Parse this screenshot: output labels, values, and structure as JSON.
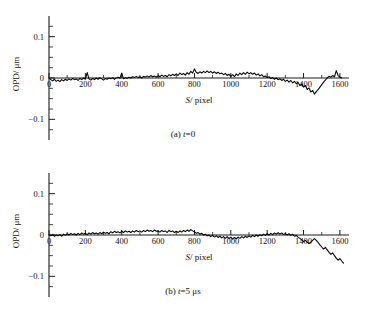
{
  "figure": {
    "panel_a_caption_prefix": "(a) ",
    "panel_a_caption_var": "t",
    "panel_a_caption_rest": "=0",
    "panel_b_caption_prefix": "(b) ",
    "panel_b_caption_var": "t",
    "panel_b_caption_rest": "=5 μs"
  },
  "axes": {
    "ylabel_main": "OPD",
    "ylabel_unit": "/ μm",
    "xlabel_var": "S",
    "xlabel_unit": "/ pixel",
    "x_ticks": [
      "0",
      "200",
      "400",
      "600",
      "800",
      "1000",
      "1200",
      "1400",
      "1600"
    ],
    "y_ticks": [
      "0.1",
      "0",
      "-0.1"
    ]
  },
  "chart_data": [
    {
      "type": "line",
      "title": "(a) t=0",
      "xlabel": "S/pixel",
      "ylabel": "OPD/μm",
      "xlim": [
        0,
        1650
      ],
      "ylim": [
        -0.15,
        0.15
      ],
      "grid": false,
      "legend": "none",
      "series": [
        {
          "name": "OPD t=0",
          "x": [
            0,
            10,
            20,
            30,
            40,
            50,
            60,
            70,
            80,
            90,
            100,
            110,
            120,
            130,
            140,
            150,
            160,
            170,
            180,
            190,
            200,
            210,
            220,
            230,
            240,
            250,
            260,
            270,
            280,
            290,
            300,
            310,
            320,
            330,
            340,
            350,
            360,
            370,
            380,
            390,
            400,
            410,
            420,
            430,
            440,
            450,
            460,
            470,
            480,
            490,
            500,
            510,
            520,
            530,
            540,
            550,
            560,
            570,
            580,
            590,
            600,
            610,
            620,
            630,
            640,
            650,
            660,
            670,
            680,
            690,
            700,
            710,
            720,
            730,
            740,
            750,
            760,
            770,
            780,
            790,
            800,
            810,
            820,
            830,
            840,
            850,
            860,
            870,
            880,
            890,
            900,
            910,
            920,
            930,
            940,
            950,
            960,
            970,
            980,
            990,
            1000,
            1010,
            1020,
            1030,
            1040,
            1050,
            1060,
            1070,
            1080,
            1090,
            1100,
            1110,
            1120,
            1130,
            1140,
            1150,
            1160,
            1170,
            1180,
            1190,
            1200,
            1210,
            1220,
            1230,
            1240,
            1250,
            1260,
            1270,
            1280,
            1290,
            1300,
            1310,
            1320,
            1330,
            1340,
            1350,
            1360,
            1370,
            1380,
            1390,
            1400,
            1410,
            1420,
            1430,
            1440,
            1450,
            1460,
            1470,
            1480,
            1490,
            1500,
            1510,
            1520,
            1530,
            1540,
            1550,
            1560,
            1570,
            1580,
            1590,
            1600,
            1610,
            1620
          ],
          "y": [
            0.0,
            -0.004,
            -0.007,
            -0.003,
            -0.008,
            -0.005,
            -0.009,
            -0.004,
            -0.007,
            -0.003,
            -0.006,
            -0.002,
            -0.005,
            -0.001,
            -0.004,
            -0.002,
            -0.006,
            -0.001,
            -0.004,
            0.0,
            -0.003,
            0.013,
            -0.002,
            -0.005,
            -0.001,
            -0.004,
            0.0,
            -0.003,
            0.001,
            -0.002,
            -0.005,
            -0.001,
            -0.003,
            0.0,
            -0.002,
            0.001,
            -0.003,
            0.0,
            0.002,
            -0.001,
            0.012,
            -0.002,
            0.001,
            -0.001,
            0.002,
            0.0,
            0.003,
            0.001,
            0.004,
            0.001,
            0.003,
            0.0,
            0.004,
            0.002,
            0.005,
            0.002,
            0.006,
            0.003,
            0.005,
            0.002,
            0.006,
            0.003,
            0.007,
            0.004,
            0.006,
            0.003,
            0.008,
            0.005,
            0.009,
            0.006,
            0.01,
            0.006,
            0.012,
            0.008,
            0.011,
            0.007,
            0.013,
            0.009,
            0.016,
            0.012,
            0.022,
            0.014,
            0.011,
            0.015,
            0.012,
            0.016,
            0.013,
            0.017,
            0.013,
            0.016,
            0.012,
            0.015,
            0.011,
            0.014,
            0.01,
            0.012,
            0.008,
            0.011,
            0.006,
            0.009,
            0.004,
            0.008,
            0.003,
            0.01,
            0.006,
            0.012,
            0.008,
            0.013,
            0.009,
            0.014,
            0.01,
            0.013,
            0.009,
            0.012,
            0.007,
            0.01,
            0.005,
            0.008,
            0.003,
            0.005,
            0.001,
            0.003,
            -0.001,
            0.001,
            -0.003,
            0.0,
            -0.004,
            -0.002,
            -0.006,
            -0.003,
            -0.008,
            -0.005,
            -0.01,
            -0.006,
            -0.012,
            -0.008,
            -0.014,
            -0.011,
            -0.018,
            -0.014,
            -0.022,
            -0.018,
            -0.028,
            -0.024,
            -0.034,
            -0.03,
            -0.039,
            -0.033,
            -0.028,
            -0.022,
            -0.016,
            -0.01,
            -0.005,
            0.0,
            0.004,
            0.002,
            0.006,
            0.003,
            0.018,
            0.006,
            0.002,
            0.0
          ]
        }
      ]
    },
    {
      "type": "line",
      "title": "(b) t=5 μs",
      "xlabel": "S/pixel",
      "ylabel": "OPD/μm",
      "xlim": [
        0,
        1650
      ],
      "ylim": [
        -0.15,
        0.15
      ],
      "grid": false,
      "legend": "none",
      "series": [
        {
          "name": "OPD t=5us",
          "x": [
            0,
            10,
            20,
            30,
            40,
            50,
            60,
            70,
            80,
            90,
            100,
            110,
            120,
            130,
            140,
            150,
            160,
            170,
            180,
            190,
            200,
            210,
            220,
            230,
            240,
            250,
            260,
            270,
            280,
            290,
            300,
            310,
            320,
            330,
            340,
            350,
            360,
            370,
            380,
            390,
            400,
            410,
            420,
            430,
            440,
            450,
            460,
            470,
            480,
            490,
            500,
            510,
            520,
            530,
            540,
            550,
            560,
            570,
            580,
            590,
            600,
            610,
            620,
            630,
            640,
            650,
            660,
            670,
            680,
            690,
            700,
            710,
            720,
            730,
            740,
            750,
            760,
            770,
            780,
            790,
            800,
            810,
            820,
            830,
            840,
            850,
            860,
            870,
            880,
            890,
            900,
            910,
            920,
            930,
            940,
            950,
            960,
            970,
            980,
            990,
            1000,
            1010,
            1020,
            1030,
            1040,
            1050,
            1060,
            1070,
            1080,
            1090,
            1100,
            1110,
            1120,
            1130,
            1140,
            1150,
            1160,
            1170,
            1180,
            1190,
            1200,
            1210,
            1220,
            1230,
            1240,
            1250,
            1260,
            1270,
            1280,
            1290,
            1300,
            1310,
            1320,
            1330,
            1340,
            1350,
            1360,
            1370,
            1380,
            1390,
            1400,
            1410,
            1420,
            1430,
            1440,
            1450,
            1460,
            1470,
            1480,
            1490,
            1500,
            1510,
            1520,
            1530,
            1540,
            1550,
            1560,
            1570,
            1580,
            1590,
            1600,
            1610,
            1620
          ],
          "y": [
            0.0,
            -0.002,
            0.001,
            -0.003,
            0.0,
            -0.002,
            0.001,
            -0.003,
            0.002,
            -0.001,
            0.003,
            0.0,
            0.004,
            0.001,
            0.003,
            0.0,
            0.004,
            0.001,
            0.005,
            0.002,
            0.004,
            0.001,
            0.005,
            0.002,
            0.006,
            0.003,
            0.005,
            0.002,
            0.006,
            0.003,
            0.007,
            0.004,
            0.006,
            0.003,
            0.008,
            0.005,
            0.009,
            0.006,
            0.008,
            0.005,
            0.009,
            0.006,
            0.01,
            0.007,
            0.009,
            0.006,
            0.01,
            0.007,
            0.011,
            0.008,
            0.01,
            0.007,
            0.011,
            0.008,
            0.012,
            0.009,
            0.011,
            0.008,
            0.012,
            0.009,
            0.01,
            0.007,
            0.011,
            0.008,
            0.01,
            0.006,
            0.011,
            0.008,
            0.01,
            0.006,
            0.009,
            0.006,
            0.01,
            0.007,
            0.011,
            0.008,
            0.012,
            0.009,
            0.013,
            0.01,
            0.008,
            0.004,
            0.006,
            0.002,
            0.004,
            0.0,
            0.002,
            -0.002,
            0.0,
            -0.004,
            -0.001,
            -0.005,
            -0.002,
            -0.006,
            -0.003,
            -0.007,
            -0.004,
            -0.008,
            -0.004,
            -0.009,
            -0.005,
            -0.01,
            -0.006,
            -0.009,
            -0.005,
            -0.008,
            -0.004,
            -0.007,
            -0.003,
            -0.006,
            -0.002,
            -0.005,
            -0.001,
            -0.004,
            0.0,
            -0.003,
            0.001,
            -0.002,
            0.002,
            -0.001,
            0.003,
            0.0,
            0.004,
            0.001,
            0.005,
            0.002,
            0.006,
            0.002,
            0.005,
            0.001,
            0.004,
            0.0,
            0.003,
            -0.001,
            0.002,
            -0.003,
            -0.001,
            -0.005,
            -0.008,
            -0.012,
            -0.016,
            -0.013,
            -0.017,
            -0.021,
            -0.017,
            -0.013,
            -0.009,
            -0.013,
            -0.018,
            -0.024,
            -0.029,
            -0.034,
            -0.03,
            -0.036,
            -0.042,
            -0.047,
            -0.043,
            -0.05,
            -0.056,
            -0.061,
            -0.057,
            -0.063,
            -0.068,
            -0.065,
            -0.07
          ]
        }
      ]
    }
  ]
}
